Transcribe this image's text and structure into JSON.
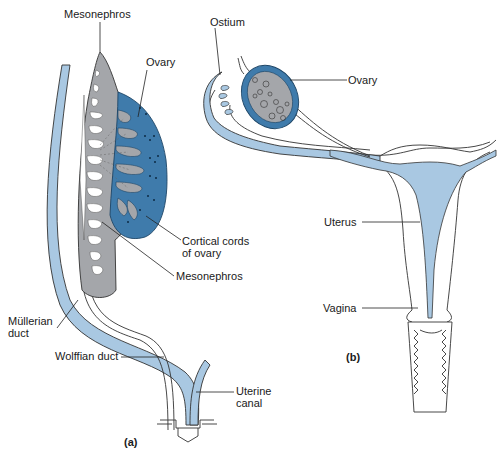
{
  "figure": {
    "panel_a": {
      "caption": "(a)",
      "labels": {
        "mesonephros_top": "Mesonephros",
        "ovary": "Ovary",
        "cortical_cords_line1": "Cortical cords",
        "cortical_cords_line2": "of ovary",
        "mesonephros_bottom": "Mesonephros",
        "mullerian_line1": "Müllerian",
        "mullerian_line2": "duct",
        "wolffian": "Wolffian duct",
        "uterine_line1": "Uterine",
        "uterine_line2": "canal"
      }
    },
    "panel_b": {
      "caption": "(b)",
      "labels": {
        "ostium": "Ostium",
        "ovary": "Ovary",
        "uterus": "Uterus",
        "vagina": "Vagina"
      }
    },
    "colors": {
      "duct_light_blue": "#a9c8e2",
      "ovary_dark_blue": "#3f7bab",
      "mesonephros_gray": "#a4a6aa",
      "outline": "#333333"
    }
  }
}
